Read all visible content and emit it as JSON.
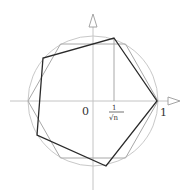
{
  "diagram": {
    "origin_label": "0",
    "tick_label_numerator": "1",
    "tick_label_denominator": "√n",
    "unit_label": "1",
    "colors": {
      "axis": "#bdbdbd",
      "circle": "#bdbdbd",
      "light_polygon": "#a8a8a8",
      "dark_polygon": "#2a2a2a",
      "text": "#333333"
    },
    "elements": [
      "unit-circle",
      "x-axis-with-arrow",
      "y-axis-with-arrow",
      "inscribed-hexagon-light",
      "rotated-pentagon-dark",
      "vertical-marker-at-1-over-sqrt-n"
    ]
  }
}
